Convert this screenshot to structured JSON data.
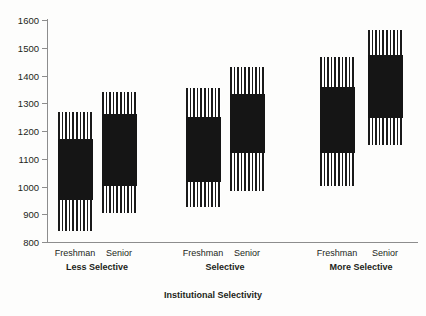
{
  "chart_data": {
    "type": "bar",
    "title": "",
    "subtitle": "",
    "xlabel": "Institutional Selectivity",
    "ylabel": "",
    "ylim": [
      800,
      1600
    ],
    "y_ticks": [
      800,
      900,
      1000,
      1100,
      1200,
      1300,
      1400,
      1500,
      1600
    ],
    "grid": false,
    "legend": "none",
    "categories": [
      "Less Selective",
      "Selective",
      "More Selective"
    ],
    "sub_categories": [
      "Freshman",
      "Senior"
    ],
    "series": [
      {
        "name": "Freshman",
        "group": "Less Selective",
        "whisker_low": 840,
        "box_low": 950,
        "box_high": 1170,
        "whisker_high": 1270
      },
      {
        "name": "Senior",
        "group": "Less Selective",
        "whisker_low": 905,
        "box_low": 1000,
        "box_high": 1260,
        "whisker_high": 1340
      },
      {
        "name": "Freshman",
        "group": "Selective",
        "whisker_low": 925,
        "box_low": 1015,
        "box_high": 1250,
        "whisker_high": 1355
      },
      {
        "name": "Senior",
        "group": "Selective",
        "whisker_low": 982,
        "box_low": 1120,
        "box_high": 1332,
        "whisker_high": 1430
      },
      {
        "name": "Freshman",
        "group": "More Selective",
        "whisker_low": 1000,
        "box_low": 1122,
        "box_high": 1358,
        "whisker_high": 1465
      },
      {
        "name": "Senior",
        "group": "More Selective",
        "whisker_low": 1150,
        "box_low": 1245,
        "box_high": 1473,
        "whisker_high": 1565
      }
    ],
    "colors": {
      "box_fill": "#151515",
      "whisker_hatch": "#1a1a1a",
      "axis": "#8d8d8d",
      "text": "#231f20",
      "background": "#fdfdfc"
    }
  },
  "axis": {
    "x_title": "Institutional Selectivity"
  },
  "labels": {
    "tick_1600": "1600",
    "tick_1500": "1500",
    "tick_1400": "1400",
    "tick_1300": "1300",
    "tick_1200": "1200",
    "tick_1100": "1100",
    "tick_1000": "1000",
    "tick_900": "900",
    "tick_800": "800"
  }
}
